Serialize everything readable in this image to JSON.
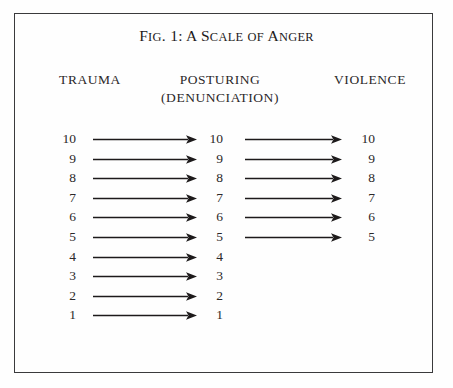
{
  "figure": {
    "title": {
      "full": "FIG. 1: A SCALE OF ANGER",
      "parts": [
        {
          "text": "F",
          "style": "cap"
        },
        {
          "text": "IG",
          "style": "smallcap"
        },
        {
          "text": ". 1: ",
          "style": "cap"
        },
        {
          "text": "A",
          "style": "cap"
        },
        {
          "text": " S",
          "style": "cap"
        },
        {
          "text": "CALE",
          "style": "smallcap"
        },
        {
          "text": " ",
          "style": "cap"
        },
        {
          "text": "OF",
          "style": "smallcap"
        },
        {
          "text": " A",
          "style": "cap"
        },
        {
          "text": "NGER",
          "style": "smallcap"
        }
      ]
    },
    "border_color": "#3a3a3c",
    "background_color": "#fefefe",
    "ink_color": "#2b2829"
  },
  "columns": {
    "left": {
      "header": "TRAUMA",
      "values": [
        "10",
        "9",
        "8",
        "7",
        "6",
        "5",
        "4",
        "3",
        "2",
        "1"
      ]
    },
    "middle": {
      "header": "POSTURING",
      "subheader": "(DENUNCIATION)",
      "values": [
        "10",
        "9",
        "8",
        "7",
        "6",
        "5",
        "4",
        "3",
        "2",
        "1"
      ]
    },
    "right": {
      "header": "VIOLENCE",
      "values": [
        "10",
        "9",
        "8",
        "7",
        "6",
        "5"
      ]
    }
  },
  "chart_data": {
    "type": "diagram",
    "title": "FIG. 1: A SCALE OF ANGER",
    "stages": [
      "TRAUMA",
      "POSTURING (DENUNCIATION)",
      "VIOLENCE"
    ],
    "scale_levels": [
      10,
      9,
      8,
      7,
      6,
      5,
      4,
      3,
      2,
      1
    ],
    "columns": [
      {
        "name": "TRAUMA",
        "values": [
          10,
          9,
          8,
          7,
          6,
          5,
          4,
          3,
          2,
          1
        ]
      },
      {
        "name": "POSTURING (DENUNCIATION)",
        "values": [
          10,
          9,
          8,
          7,
          6,
          5,
          4,
          3,
          2,
          1
        ]
      },
      {
        "name": "VIOLENCE",
        "values": [
          10,
          9,
          8,
          7,
          6,
          5
        ]
      }
    ],
    "arrows": [
      {
        "from": "TRAUMA",
        "to": "POSTURING",
        "levels": [
          10,
          9,
          8,
          7,
          6,
          5,
          4,
          3,
          2,
          1
        ]
      },
      {
        "from": "POSTURING",
        "to": "VIOLENCE",
        "levels": [
          10,
          9,
          8,
          7,
          6,
          5
        ]
      }
    ]
  },
  "rows": [
    {
      "level": "10",
      "trauma": "10",
      "posturing": "10",
      "violence": "10",
      "arrow_a": true,
      "arrow_b": true
    },
    {
      "level": "9",
      "trauma": "9",
      "posturing": "9",
      "violence": "9",
      "arrow_a": true,
      "arrow_b": true
    },
    {
      "level": "8",
      "trauma": "8",
      "posturing": "8",
      "violence": "8",
      "arrow_a": true,
      "arrow_b": true
    },
    {
      "level": "7",
      "trauma": "7",
      "posturing": "7",
      "violence": "7",
      "arrow_a": true,
      "arrow_b": true
    },
    {
      "level": "6",
      "trauma": "6",
      "posturing": "6",
      "violence": "6",
      "arrow_a": true,
      "arrow_b": true
    },
    {
      "level": "5",
      "trauma": "5",
      "posturing": "5",
      "violence": "5",
      "arrow_a": true,
      "arrow_b": true
    },
    {
      "level": "4",
      "trauma": "4",
      "posturing": "4",
      "violence": "",
      "arrow_a": true,
      "arrow_b": false
    },
    {
      "level": "3",
      "trauma": "3",
      "posturing": "3",
      "violence": "",
      "arrow_a": true,
      "arrow_b": false
    },
    {
      "level": "2",
      "trauma": "2",
      "posturing": "2",
      "violence": "",
      "arrow_a": true,
      "arrow_b": false
    },
    {
      "level": "1",
      "trauma": "1",
      "posturing": "1",
      "violence": "",
      "arrow_a": true,
      "arrow_b": false
    }
  ]
}
